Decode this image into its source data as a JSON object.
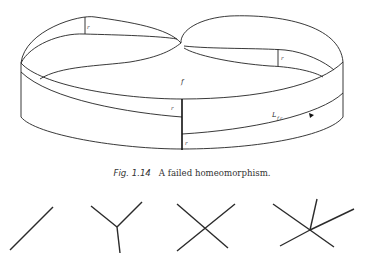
{
  "figure": {
    "caption_label": "Fig. 1.14",
    "caption_text": "A failed homeomorphism.",
    "labels": {
      "r_top_left": "r",
      "r_top_right": "r",
      "f": "f",
      "r_front_upper": "r",
      "r_front_lower": "r",
      "L": "L",
      "L_sub": "f,r"
    }
  },
  "graphs": [
    {
      "name": "line",
      "degree": 2
    },
    {
      "name": "tripod",
      "degree": 3
    },
    {
      "name": "cross",
      "degree": 4
    },
    {
      "name": "star-5",
      "degree": 5
    }
  ]
}
